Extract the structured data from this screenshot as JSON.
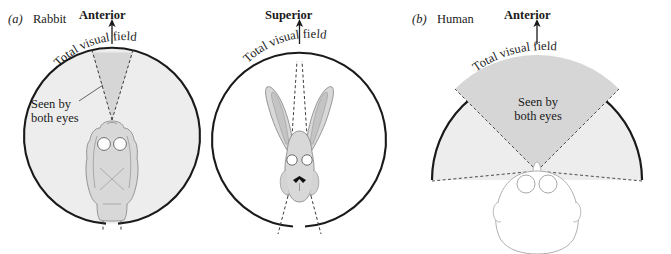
{
  "figure": {
    "caption_style": "scientific-diagram",
    "background_color": "#ffffff",
    "ink_color": "#1a1a1a",
    "shade_color": "#d9d9d9",
    "body_fill": "#dcdcdc"
  },
  "panels": [
    {
      "id": "(a)",
      "id_italic": "a",
      "name": "Rabbit",
      "view": "dorsal",
      "direction_label": "Anterior",
      "total_field_label": "Total visual field",
      "binocular_label_line1": "Seen by",
      "binocular_label_line2": "both eyes",
      "field_shape": "near-full-circle",
      "field_degrees": 345,
      "binocular_degrees": 30
    },
    {
      "id": "",
      "id_italic": "",
      "name": "",
      "view": "frontal",
      "direction_label": "Superior",
      "total_field_label": "Total visual field",
      "binocular_label_line1": "",
      "binocular_label_line2": "",
      "field_shape": "near-full-circle",
      "field_degrees": 345,
      "binocular_degrees": 20
    },
    {
      "id": "(b)",
      "id_italic": "b",
      "name": "Human",
      "view": "dorsal",
      "direction_label": "Anterior",
      "total_field_label": "Total visual field",
      "binocular_label_line1": "Seen by",
      "binocular_label_line2": "both eyes",
      "field_shape": "wide-arc",
      "field_degrees": 190,
      "binocular_degrees": 120
    }
  ],
  "colors": {
    "shaded_field": "#d9d9d9",
    "animal_body": "#d8d8d8",
    "outline": "#1a1a1a",
    "faint_outline": "#a8a8a8"
  }
}
